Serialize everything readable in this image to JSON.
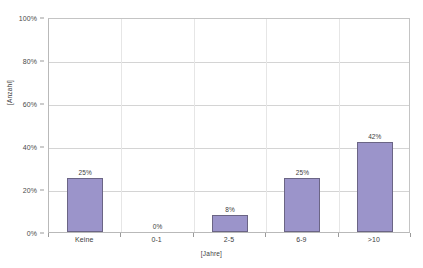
{
  "chart_data": {
    "type": "bar",
    "title": "",
    "categories": [
      "Keine",
      "0-1",
      "2-5",
      "6-9",
      ">10"
    ],
    "values": [
      25,
      0,
      8,
      25,
      42
    ],
    "data_labels": [
      "25%",
      "0%",
      "8%",
      "25%",
      "42%"
    ],
    "xlabel": "[Jahre]",
    "ylabel": "[Anzahl]",
    "ylim": [
      0,
      100
    ],
    "y_ticks": [
      0,
      20,
      40,
      60,
      80,
      100
    ],
    "y_tick_labels": [
      "0%",
      "20%",
      "40%",
      "60%",
      "80%",
      "100%"
    ],
    "grid": true,
    "legend": false,
    "series": [
      {
        "name": "",
        "values": [
          25,
          0,
          8,
          25,
          42
        ]
      }
    ],
    "colors": {
      "bar_fill": "#9b94ca",
      "bar_border": "#6b6585",
      "gridline": "#d4d4d4",
      "axis": "#b9b9b9",
      "text": "#3d3d3d",
      "background": "#ffffff"
    }
  }
}
